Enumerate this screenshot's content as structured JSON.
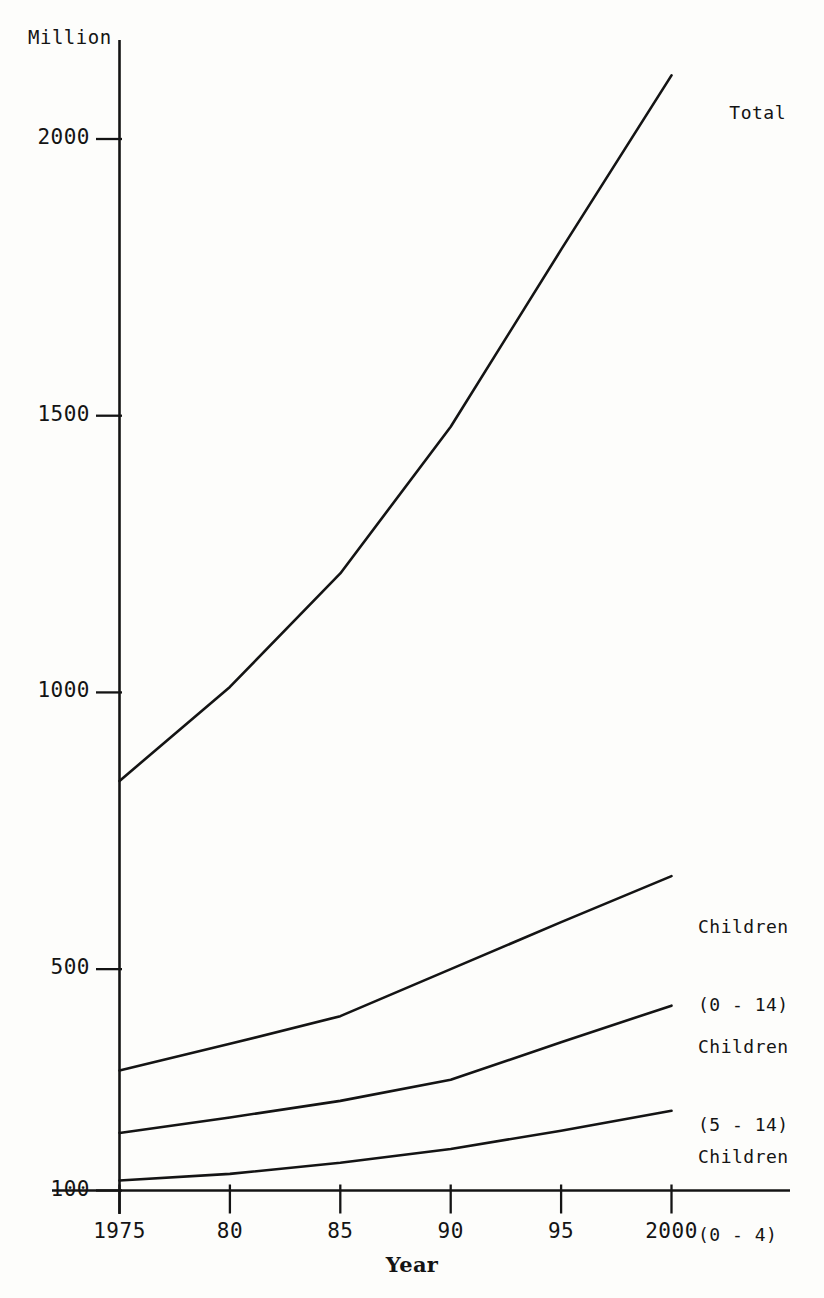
{
  "page": {
    "background_color": "#fdfdfb",
    "ink_color": "#141414"
  },
  "axis": {
    "unit_label": "Million",
    "x_title": "Year",
    "y_ticks": [
      {
        "label": "2000",
        "value": 2000
      },
      {
        "label": "1500",
        "value": 1500
      },
      {
        "label": "1000",
        "value": 1000
      },
      {
        "label": "500",
        "value": 500
      },
      {
        "label": "100",
        "value": 100
      }
    ],
    "x_ticks": [
      {
        "label": "1975",
        "value": 1975
      },
      {
        "label": "80",
        "value": 1980
      },
      {
        "label": "85",
        "value": 1985
      },
      {
        "label": "90",
        "value": 1990
      },
      {
        "label": "95",
        "value": 1995
      },
      {
        "label": "2000",
        "value": 2000
      }
    ]
  },
  "series_labels": {
    "total": "Total",
    "children_0_14_line1": "Children",
    "children_0_14_line2": "(0 - 14)",
    "children_5_14_line1": "Children",
    "children_5_14_line2": "(5 - 14)",
    "children_0_4_line1": "Children",
    "children_0_4_line2": "(0 - 4)"
  },
  "chart_data": {
    "type": "line",
    "title": "",
    "subtitle": "",
    "xlabel": "Year",
    "ylabel": "Million",
    "x": [
      1975,
      1980,
      1985,
      1990,
      1995,
      2000
    ],
    "xlim": [
      1975,
      2000
    ],
    "ylim": [
      100,
      2150
    ],
    "grid": false,
    "legend_position": "inline-right",
    "series": [
      {
        "name": "Total",
        "label": "Total",
        "values": [
          840,
          1010,
          1215,
          1480,
          1800,
          2115
        ]
      },
      {
        "name": "Children (0 - 14)",
        "label": "Children\n(0 - 14)",
        "values": [
          317,
          365,
          415,
          500,
          585,
          668
        ]
      },
      {
        "name": "Children (5 - 14)",
        "label": "Children\n(5 - 14)",
        "values": [
          204,
          232,
          262,
          300,
          368,
          434
        ]
      },
      {
        "name": "Children (0 - 4)",
        "label": "Children\n(0 - 4)",
        "values": [
          118,
          130,
          150,
          175,
          208,
          244
        ]
      }
    ]
  }
}
